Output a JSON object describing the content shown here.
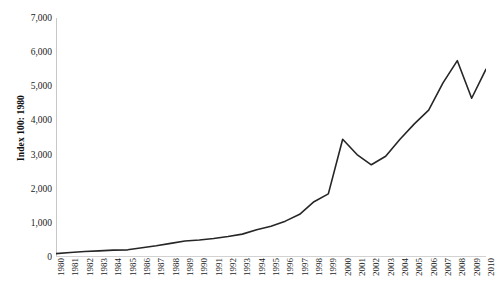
{
  "chart_data": {
    "type": "line",
    "title": "",
    "subtitle": "",
    "xlabel": "",
    "ylabel": "Index 100: 1980",
    "xlim": [
      1980,
      2010
    ],
    "ylim": [
      0,
      7000
    ],
    "grid": false,
    "legend": "none",
    "line_color": "#262626",
    "x": [
      1980,
      1981,
      1982,
      1983,
      1984,
      1985,
      1986,
      1987,
      1988,
      1989,
      1990,
      1991,
      1992,
      1993,
      1994,
      1995,
      1996,
      1997,
      1998,
      1999,
      2000,
      2001,
      2002,
      2003,
      2004,
      2005,
      2006,
      2007,
      2008,
      2009,
      2010
    ],
    "categories": [
      "1980",
      "1981",
      "1982",
      "1983",
      "1984",
      "1985",
      "1986",
      "1987",
      "1988",
      "1989",
      "1990",
      "1991",
      "1992",
      "1993",
      "1994",
      "1995",
      "1996",
      "1997",
      "1998",
      "1999",
      "2000",
      "2001",
      "2002",
      "2003",
      "2004",
      "2005",
      "2006",
      "2007",
      "2008",
      "2009",
      "2010"
    ],
    "series": [
      {
        "name": "Index",
        "values": [
          100,
          130,
          160,
          180,
          200,
          210,
          270,
          330,
          400,
          470,
          500,
          540,
          600,
          670,
          800,
          900,
          1050,
          1250,
          1620,
          1850,
          3450,
          3000,
          2700,
          2950,
          3450,
          3900,
          4300,
          5100,
          5750,
          4650,
          5500
        ]
      }
    ],
    "y_ticks": [
      0,
      1000,
      2000,
      3000,
      4000,
      5000,
      6000,
      7000
    ],
    "y_tick_labels": [
      "0",
      "1,000",
      "2,000",
      "3,000",
      "4,000",
      "5,000",
      "6,000",
      "7,000"
    ]
  }
}
